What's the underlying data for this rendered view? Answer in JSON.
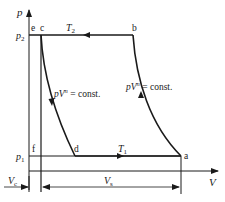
{
  "diagram": {
    "type": "p-V cycle diagram",
    "axes": {
      "y_label": "p",
      "x_label": "V",
      "y_ticks": [
        "p2",
        "p1"
      ],
      "y_tick_display": {
        "p2_base": "p",
        "p2_sub": "2",
        "p1_base": "p",
        "p1_sub": "1"
      }
    },
    "points": {
      "e": "e",
      "c": "c",
      "b": "b",
      "f": "f",
      "d": "d",
      "a": "a"
    },
    "isotherms": {
      "top": {
        "base": "T",
        "sub": "2"
      },
      "bottom": {
        "base": "T",
        "sub": "1"
      }
    },
    "curves": {
      "left": {
        "text_pv": "pV",
        "exp": "n",
        "rest": " = const."
      },
      "right": {
        "text_pv": "pV",
        "exp": "n",
        "rest": " = const."
      }
    },
    "volumes": {
      "clearance": {
        "base": "V",
        "sub": "c"
      },
      "swept": {
        "base": "V",
        "sub": "s"
      }
    },
    "colors": {
      "line": "#1a1a1a",
      "background": "#ffffff"
    }
  }
}
